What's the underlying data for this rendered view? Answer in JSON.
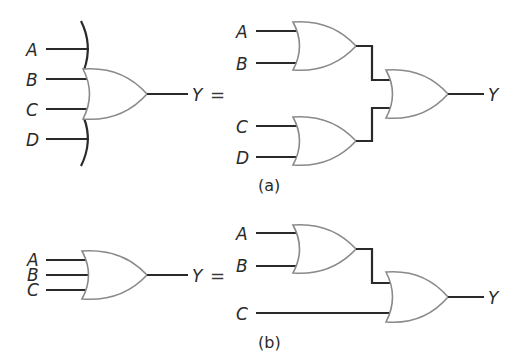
{
  "diagram": {
    "type": "logic-circuit",
    "colors": {
      "wire": "#2a2a2a",
      "gate_outline": "#8a8a8a",
      "background": "#ffffff"
    },
    "equals_sign": "=",
    "part_a": {
      "caption": "(a)",
      "left": {
        "inputs": [
          "A",
          "B",
          "C",
          "D"
        ],
        "output": "Y",
        "gate": "OR (4-input, extended-input bracket)"
      },
      "right": {
        "gate1_inputs": [
          "A",
          "B"
        ],
        "gate2_inputs": [
          "C",
          "D"
        ],
        "output": "Y",
        "structure": "OR(OR(A,B), OR(C,D))"
      }
    },
    "part_b": {
      "caption": "(b)",
      "left": {
        "inputs": [
          "A",
          "B",
          "C"
        ],
        "output": "Y",
        "gate": "OR (3-input)"
      },
      "right": {
        "gate1_inputs": [
          "A",
          "B"
        ],
        "gate2_direct_input": "C",
        "output": "Y",
        "structure": "OR(OR(A,B), C)"
      }
    }
  }
}
